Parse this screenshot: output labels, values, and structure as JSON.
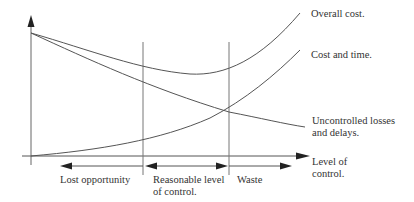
{
  "diagram": {
    "type": "cost-of-control curves",
    "colors": {
      "line": "#555555",
      "text": "#333333",
      "background": "#ffffff"
    },
    "curves": [
      {
        "name": "Overall cost.",
        "shape": "U-shaped: falls from top-left, minimum mid-right, rises steeply"
      },
      {
        "name": "Cost and time.",
        "shape": "rising convex from origin"
      },
      {
        "name": "Uncontrolled losses and delays.",
        "shape": "falling from top-left"
      }
    ],
    "labels": {
      "overall_cost": "Overall cost.",
      "cost_and_time": "Cost and time.",
      "uncontrolled_line1": "Uncontrolled losses",
      "uncontrolled_line2": "and delays.",
      "x_axis_line1": "Level of",
      "x_axis_line2": "control.",
      "zone_lost": "Lost opportunity",
      "zone_reasonable_line1": "Reasonable level",
      "zone_reasonable_line2": "of control.",
      "zone_waste": "Waste"
    },
    "zones": [
      "Lost opportunity",
      "Reasonable level of control.",
      "Waste"
    ]
  }
}
